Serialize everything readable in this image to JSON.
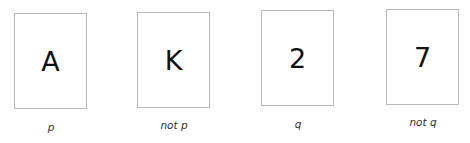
{
  "cards": [
    {
      "face": "A",
      "label": "p"
    },
    {
      "face": "K",
      "label": "not p"
    },
    {
      "face": "2",
      "label": "q"
    },
    {
      "face": "7",
      "label": "not q"
    }
  ]
}
